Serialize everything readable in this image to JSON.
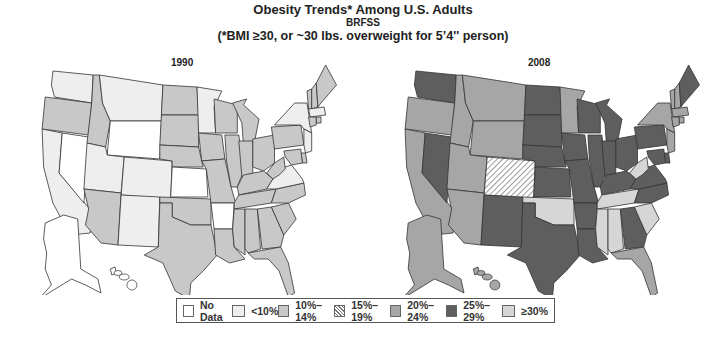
{
  "header": {
    "title": "Obesity Trends* Among U.S. Adults",
    "source": "BRFSS",
    "footnote": "(*BMI ≥30, or ~30 lbs. overweight for 5’4'' person)"
  },
  "maps": [
    {
      "year": "1990"
    },
    {
      "year": "2008"
    }
  ],
  "legend": {
    "items": [
      {
        "label": "No Data",
        "color": "#ffffff",
        "pattern": "none"
      },
      {
        "label": "<10%",
        "color": "#eeeeee",
        "pattern": "none"
      },
      {
        "label": "10%–14%",
        "color": "#c8c8c8",
        "pattern": "none"
      },
      {
        "label": "15%–19%",
        "color": "#ffffff",
        "pattern": "hatch"
      },
      {
        "label": "20%–24%",
        "color": "#a6a6a6",
        "pattern": "none"
      },
      {
        "label": "25%–29%",
        "color": "#5e5e5e",
        "pattern": "none"
      },
      {
        "label": "≥30%",
        "color": "#d6d6d6",
        "pattern": "none"
      }
    ]
  },
  "chart_data": {
    "type": "choropleth",
    "title": "Obesity Trends* Among U.S. Adults",
    "subtitle": "BRFSS",
    "note": "(*BMI ≥30, or ~30 lbs. overweight for 5'4'' person)",
    "categories": [
      "No Data",
      "<10%",
      "10%–14%",
      "15%–19%",
      "20%–24%",
      "25%–29%",
      "≥30%"
    ],
    "maps": [
      {
        "year": "1990",
        "states": {
          "WA": "<10%",
          "OR": "10%–14%",
          "CA": "<10%",
          "NV": "No Data",
          "ID": "10%–14%",
          "MT": "<10%",
          "WY": "No Data",
          "UT": "<10%",
          "CO": "<10%",
          "AZ": "10%–14%",
          "NM": "<10%",
          "ND": "10%–14%",
          "SD": "10%–14%",
          "NE": "10%–14%",
          "KS": "No Data",
          "OK": "10%–14%",
          "TX": "10%–14%",
          "MN": "<10%",
          "IA": "10%–14%",
          "MO": "10%–14%",
          "AR": "No Data",
          "LA": "10%–14%",
          "WI": "10%–14%",
          "IL": "10%–14%",
          "MI": "10%–14%",
          "IN": "10%–14%",
          "OH": "10%–14%",
          "KY": "10%–14%",
          "TN": "10%–14%",
          "MS": "10%–14%",
          "AL": "10%–14%",
          "GA": "10%–14%",
          "FL": "10%–14%",
          "SC": "10%–14%",
          "NC": "10%–14%",
          "VA": "<10%",
          "WV": "10%–14%",
          "PA": "10%–14%",
          "NY": "<10%",
          "VT": "10%–14%",
          "NH": "10%–14%",
          "ME": "10%–14%",
          "MA": "<10%",
          "CT": "10%–14%",
          "RI": "10%–14%",
          "NJ": "<10%",
          "DE": "10%–14%",
          "MD": "10%–14%",
          "AK": "No Data",
          "HI": "No Data"
        }
      },
      {
        "year": "2008",
        "states": {
          "WA": "25%–29%",
          "OR": "20%–24%",
          "CA": "20%–24%",
          "NV": "25%–29%",
          "ID": "20%–24%",
          "MT": "20%–24%",
          "WY": "20%–24%",
          "UT": "20%–24%",
          "CO": "15%–19%",
          "AZ": "20%–24%",
          "NM": "25%–29%",
          "ND": "25%–29%",
          "SD": "25%–29%",
          "NE": "25%–29%",
          "KS": "25%–29%",
          "OK": "≥30%",
          "TX": "25%–29%",
          "MN": "20%–24%",
          "IA": "25%–29%",
          "MO": "25%–29%",
          "AR": "25%–29%",
          "LA": "25%–29%",
          "WI": "25%–29%",
          "IL": "25%–29%",
          "MI": "25%–29%",
          "IN": "25%–29%",
          "OH": "25%–29%",
          "KY": "25%–29%",
          "TN": "≥30%",
          "MS": "≥30%",
          "AL": "≥30%",
          "GA": "25%–29%",
          "FL": "20%–24%",
          "SC": "≥30%",
          "NC": "25%–29%",
          "VA": "25%–29%",
          "WV": "≥30%",
          "PA": "25%–29%",
          "NY": "20%–24%",
          "VT": "20%–24%",
          "NH": "20%–24%",
          "ME": "25%–29%",
          "MA": "20%–24%",
          "CT": "20%–24%",
          "RI": "20%–24%",
          "NJ": "20%–24%",
          "DE": "25%–29%",
          "MD": "25%–29%",
          "AK": "20%–24%",
          "HI": "20%–24%"
        }
      }
    ],
    "legend_position": "bottom"
  }
}
